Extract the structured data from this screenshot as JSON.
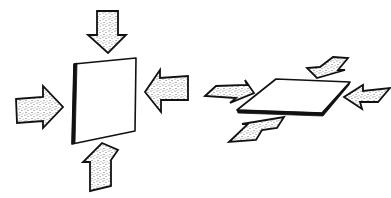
{
  "diagram": {
    "colors": {
      "line": "#111111",
      "fill": "#ffffff",
      "stipple": "#555555"
    },
    "figures": [
      {
        "id": "vertical-plate",
        "label": "Upright plate compressed from four sides",
        "plate": {
          "points": "74,64 136,58 135,131 72,144",
          "edge": "72,144 74,64 77,63 75,143"
        },
        "arrows": [
          {
            "name": "arrow-top-down",
            "direction": "down",
            "points": "97,11 118,11 118,35 126,35 108,53 88,35 97,35"
          },
          {
            "name": "arrow-left-right",
            "direction": "right",
            "points": "16,99 43,97 43,86 63,107 43,128 43,121 17,123"
          },
          {
            "name": "arrow-right-left",
            "direction": "left",
            "points": "188,76 188,100 161,100 161,112 145,92 160,70 160,78"
          },
          {
            "name": "arrow-bottom-up",
            "direction": "up",
            "points": "102,143 118,150 111,160 111,186 90,191 90,162 83,162"
          }
        ]
      },
      {
        "id": "horizontal-plate",
        "label": "Flat plate compressed from four sides",
        "plate": {
          "points": "276,79 350,82 322,113 237,110",
          "edge": "237,110 322,113 350,82 349,85 323,116 238,113"
        },
        "arrows": [
          {
            "name": "arrow-left-in",
            "direction": "right",
            "points": "205,96 216,86 247,85 245,80 254,93 230,103 236,98"
          },
          {
            "name": "arrow-top-in",
            "direction": "down-left",
            "points": "333,57 348,58 338,70 345,70 317,78 307,68 320,67"
          },
          {
            "name": "arrow-right-in",
            "direction": "left",
            "points": "390,88 378,102 360,102 362,109 344,97 363,85 363,91"
          },
          {
            "name": "arrow-bottom-in",
            "direction": "up-right",
            "points": "229,142 248,124 242,124 284,117 277,128 262,130 256,140"
          }
        ]
      }
    ]
  }
}
